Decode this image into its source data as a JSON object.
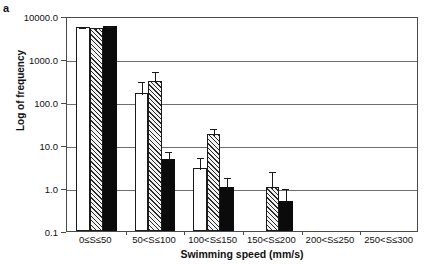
{
  "panel_label": "a",
  "chart_data": {
    "type": "bar",
    "title": "",
    "xlabel": "Swimming speed (mm/s)",
    "ylabel": "Log of frequency",
    "yscale": "log",
    "ylim": [
      0.1,
      10000
    ],
    "ytick_labels": [
      "0.1",
      "1.0",
      "10.0",
      "100.0",
      "1000.0",
      "10000.0"
    ],
    "ytick_values": [
      0.1,
      1,
      10,
      100,
      1000,
      10000
    ],
    "grid": true,
    "legend": "none",
    "categories": [
      "0≤S≤50",
      "50<S≤100",
      "100<S≤150",
      "150<S≤200",
      "200<S≤250",
      "250<S≤300"
    ],
    "series": [
      {
        "name": "open",
        "fill": "white",
        "values": [
          5500,
          160,
          2.9,
          null,
          null,
          null
        ],
        "err_low": [
          5200,
          95,
          1.6,
          null,
          null,
          null
        ],
        "err_high": [
          5900,
          330,
          5.5,
          null,
          null,
          null
        ]
      },
      {
        "name": "hatched",
        "fill": "diagonal-hatch",
        "values": [
          5400,
          300,
          18,
          1.05,
          null,
          null
        ],
        "err_low": [
          5100,
          180,
          13,
          1.0,
          null,
          null
        ],
        "err_high": [
          5800,
          560,
          26,
          2.6,
          null,
          null
        ]
      },
      {
        "name": "solid",
        "fill": "black",
        "values": [
          5800,
          4.8,
          1.05,
          0.5,
          null,
          null
        ],
        "err_low": [
          5500,
          3.2,
          1.0,
          0.45,
          null,
          null
        ],
        "err_high": [
          6100,
          7.5,
          1.9,
          1.05,
          null,
          null
        ]
      }
    ]
  }
}
